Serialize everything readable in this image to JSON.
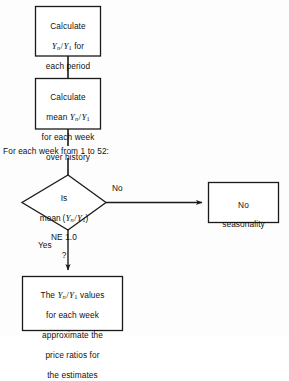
{
  "diagram": {
    "type": "flowchart",
    "background_color": "#fdfdfd",
    "line_color": "#1a1a1a",
    "text_color": "#111111",
    "nodes": [
      {
        "id": "box1",
        "shape": "rectangle",
        "text": "Calculate Yn / Y1 for each period",
        "lines": [
          "Calculate",
          "Yn / Y1 for",
          "each period"
        ]
      },
      {
        "id": "box2",
        "shape": "rectangle",
        "text": "Calculate mean Yn / Y1 for each week over history",
        "lines": [
          "Calculate",
          "mean Yn / Y1",
          "for each week",
          "over history"
        ]
      },
      {
        "id": "loop-label",
        "shape": "text",
        "text": "For each week from 1 to 52:"
      },
      {
        "id": "decision",
        "shape": "diamond",
        "text": "Is mean (Yn / Y1) NE 1.0 ?",
        "lines": [
          "Is",
          "mean (Yn / Y1)",
          "NE 1.0",
          "?"
        ]
      },
      {
        "id": "no-box",
        "shape": "rectangle",
        "text": "No seasonality",
        "lines": [
          "No",
          "seasonality"
        ]
      },
      {
        "id": "yes-box",
        "shape": "rectangle",
        "text": "The Yn / Y1 values for each week approximate the price ratios for the estimates",
        "lines": [
          "The Yn / Y1 values",
          "for each week",
          "approximate the",
          "price ratios for",
          "the estimates"
        ]
      }
    ],
    "edges": [
      {
        "id": "e1",
        "from": "box1",
        "to": "box2",
        "label": "",
        "arrow": false
      },
      {
        "id": "e2",
        "from": "box2",
        "to": "decision",
        "label": "",
        "arrow": false
      },
      {
        "id": "e3",
        "from": "decision",
        "to": "no-box",
        "label": "No",
        "arrow": true
      },
      {
        "id": "e4",
        "from": "decision",
        "to": "yes-box",
        "label": "Yes",
        "arrow": true
      }
    ],
    "labels": {
      "no": "No",
      "yes": "Yes"
    }
  }
}
